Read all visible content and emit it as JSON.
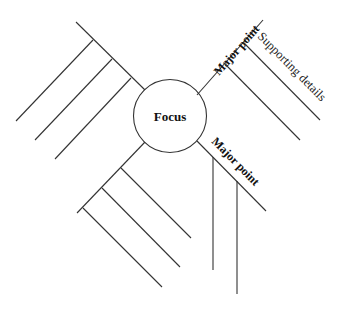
{
  "diagram": {
    "type": "spider-map",
    "focus": {
      "label": "Focus"
    },
    "branches": [
      {
        "position": "upper-right",
        "label": "Major point",
        "details": [
          {
            "label": "Supporting details"
          },
          {
            "label": ""
          }
        ]
      },
      {
        "position": "lower-right",
        "label": "Major point",
        "details": [
          {
            "label": ""
          },
          {
            "label": ""
          }
        ]
      },
      {
        "position": "upper-left",
        "label": "",
        "details": [
          {
            "label": ""
          },
          {
            "label": ""
          },
          {
            "label": ""
          }
        ]
      },
      {
        "position": "lower-left",
        "label": "",
        "details": [
          {
            "label": ""
          },
          {
            "label": ""
          },
          {
            "label": ""
          }
        ]
      }
    ]
  }
}
